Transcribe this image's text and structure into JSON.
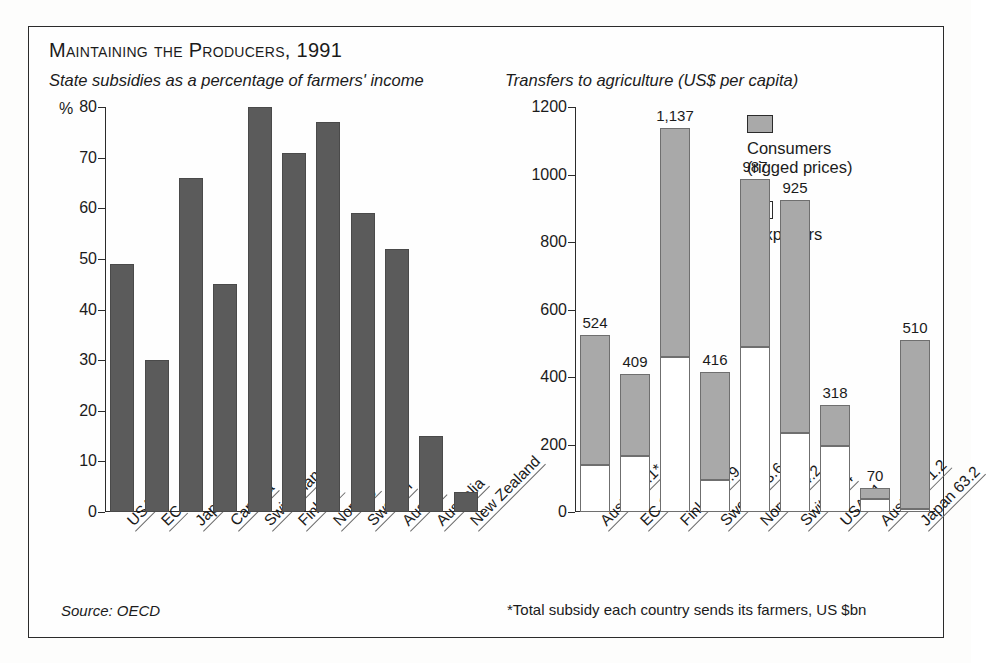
{
  "figure": {
    "title": "Maintaining the Producers, 1991",
    "source_note": "Source: OECD",
    "footnote_right": "*Total subsidy each country sends its farmers, US $bn"
  },
  "chart_data": [
    {
      "type": "bar",
      "title": "State subsidies as a percentage of farmers' income",
      "xlabel": "",
      "ylabel": "%",
      "ylim": [
        0,
        80
      ],
      "yticks": [
        0,
        10,
        20,
        30,
        40,
        50,
        60,
        70,
        80
      ],
      "grid": false,
      "legend": "none",
      "bar_color": "#5b5b5b",
      "categories": [
        "USA",
        "EC",
        "Japan",
        "Canada",
        "Switzerland",
        "Finland",
        "Norway",
        "Sweden",
        "Austria",
        "Australia",
        "New Zealand"
      ],
      "values": [
        49,
        30,
        66,
        45,
        80,
        71,
        77,
        59,
        52,
        15,
        4
      ]
    },
    {
      "type": "bar",
      "subtype": "stacked",
      "title": "Transfers to agriculture (US$ per capita)",
      "xlabel": "",
      "ylabel": "",
      "ylim": [
        0,
        1200
      ],
      "yticks": [
        0,
        200,
        400,
        600,
        800,
        1000,
        1200
      ],
      "grid": false,
      "legend_position": "top-right",
      "categories": [
        "Austria 4.1*",
        "EC 142",
        "Finland 5.9",
        "Sweden 3.6",
        "Norway 4.2",
        "Switz. 6.4",
        "USA 81",
        "Australia 1.2",
        "Japan 63.2"
      ],
      "totals": [
        524,
        409,
        1137,
        416,
        987,
        925,
        318,
        70,
        510
      ],
      "total_labels": [
        "524",
        "409",
        "1,137",
        "416",
        "987",
        "925",
        "318",
        "70",
        "510"
      ],
      "series": [
        {
          "name": "Taxpayers",
          "color": "#ffffff",
          "values": [
            140,
            165,
            460,
            95,
            490,
            235,
            197,
            38,
            8
          ]
        },
        {
          "name": "Consumers (rigged prices)",
          "color": "#a9a9a9",
          "values": [
            384,
            244,
            677,
            321,
            497,
            690,
            121,
            32,
            502
          ]
        }
      ],
      "legend_entries": [
        {
          "label_line1": "Consumers",
          "label_line2": "(rigged prices)",
          "swatch": "consumers"
        },
        {
          "label_line1": "Taxpayers",
          "label_line2": "",
          "swatch": "taxpayers"
        }
      ]
    }
  ]
}
